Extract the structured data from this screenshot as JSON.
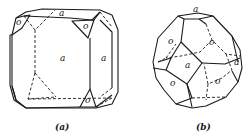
{
  "figure": {
    "panels": [
      {
        "id": "a",
        "caption": "(a)",
        "description": "Cube modified by small octahedron faces",
        "face_labels": {
          "top": "a",
          "front": "a",
          "right": "a",
          "corner_top_left": "o",
          "corner_top_right": "o",
          "corner_bottom_right": "o"
        }
      },
      {
        "id": "b",
        "caption": "(b)",
        "description": "Truncated octahedron (cube + octahedron faces)",
        "face_labels": {
          "top": "a",
          "center": "a",
          "right": "a",
          "upper_left": "o",
          "upper_right": "o",
          "lower_left": "o",
          "lower_right": "o"
        }
      }
    ],
    "colors": {
      "line": "#1a1a1a",
      "background": "#ffffff"
    }
  }
}
